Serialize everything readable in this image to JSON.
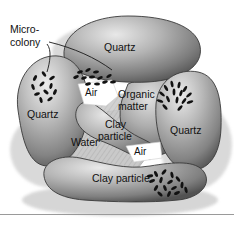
{
  "figure": {
    "background_color": "#ffffff",
    "outline_color": "#3a3a3a",
    "text_color": "#111111",
    "air_color": "#ffffff",
    "water_color": "#c9c9c9",
    "grain_light": "#e4e4e4",
    "grain_mid": "#9d9d9d",
    "grain_dark": "#4e4e4e",
    "shadow_color": "#b5b5b5"
  },
  "labels": {
    "microcolony": "Micro-\ncolony",
    "microcolony_line1": "Micro-",
    "microcolony_line2": "colony",
    "quartz_top": "Quartz",
    "quartz_left": "Quartz",
    "quartz_right": "Quartz",
    "air_upper": "Air",
    "air_lower": "Air",
    "organic_matter_line1": "Organic",
    "organic_matter_line2": "matter",
    "clay_particle_center_line1": "Clay",
    "clay_particle_center_line2": "particle",
    "clay_particle_bottom": "Clay particle",
    "water": "Water"
  },
  "colonies": [
    {
      "name": "micro-colony-left-quartz",
      "count": 11,
      "style": "scattered-rods"
    },
    {
      "name": "micro-colony-top-quartz-edge",
      "count": 12,
      "style": "scattered-rods"
    },
    {
      "name": "micro-colony-organic-matter",
      "count": 15,
      "style": "radial-burst"
    },
    {
      "name": "micro-colony-bottom-clay",
      "count": 16,
      "style": "scattered-rods"
    }
  ]
}
